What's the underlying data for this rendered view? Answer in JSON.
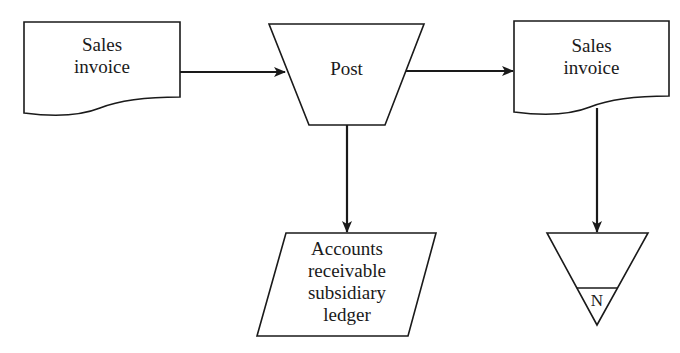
{
  "diagram": {
    "type": "flowchart",
    "nodes": [
      {
        "id": "sales-invoice-in",
        "shape": "document",
        "label": "Sales\ninvoice"
      },
      {
        "id": "post",
        "shape": "manual-operation",
        "label": "Post"
      },
      {
        "id": "sales-invoice-out",
        "shape": "document",
        "label": "Sales\ninvoice"
      },
      {
        "id": "ar-ledger",
        "shape": "data-io",
        "label": "Accounts\nreceivable\nsubsidiary\nledger"
      },
      {
        "id": "file-n",
        "shape": "offline-storage",
        "label": "N"
      }
    ],
    "edges": [
      {
        "from": "sales-invoice-in",
        "to": "post"
      },
      {
        "from": "post",
        "to": "sales-invoice-out"
      },
      {
        "from": "post",
        "to": "ar-ledger"
      },
      {
        "from": "sales-invoice-out",
        "to": "file-n"
      }
    ],
    "colors": {
      "stroke": "#1a1a1a",
      "fill": "#ffffff",
      "background": "#ffffff"
    }
  }
}
